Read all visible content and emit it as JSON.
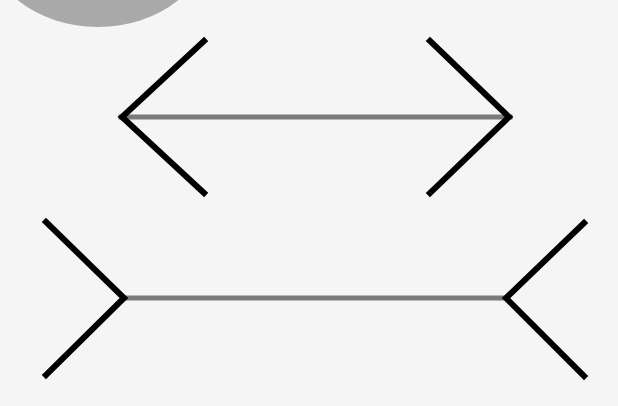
{
  "diagram": {
    "colors": {
      "background": "#f5f5f5",
      "fins": "#000000",
      "shaft": "#7a7a7a",
      "blob": "#a9a9a9"
    },
    "top_figure": {
      "shaft": [
        121,
        117,
        510,
        117
      ],
      "style": "arrowheads-outward"
    },
    "bottom_figure": {
      "shaft": [
        124,
        298,
        505,
        298
      ],
      "style": "fins-inward"
    }
  }
}
